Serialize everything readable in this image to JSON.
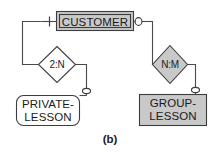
{
  "figure": {
    "caption": "(b)",
    "type": "entity-relationship-diagram"
  },
  "colors": {
    "fill_gray": "#c9c9c9",
    "fill_white": "#ffffff",
    "stroke": "#3d3d3d",
    "edge": "#4a4a4a",
    "text": "#1a1a1a",
    "background": "#ffffff"
  },
  "entities": {
    "customer": {
      "label": "CUSTOMER",
      "shape": "double-rectangle",
      "fill": "#c9c9c9"
    },
    "private_lesson": {
      "label_line1": "PRIVATE-",
      "label_line2": "LESSON",
      "shape": "rounded-rectangle",
      "fill": "#ffffff"
    },
    "group_lesson": {
      "label_line1": "GROUP-",
      "label_line2": "LESSON",
      "shape": "rectangle",
      "fill": "#c9c9c9"
    }
  },
  "relationships": {
    "left": {
      "label": "2:N",
      "shape": "diamond",
      "fill": "#ffffff"
    },
    "right": {
      "label": "N:M",
      "shape": "diamond",
      "fill": "#c9c9c9"
    }
  },
  "connectors": {
    "customer_left": {
      "symbol": "mandatory-tick",
      "glyph": "|"
    },
    "customer_right": {
      "symbol": "optional-circle",
      "glyph": "o"
    },
    "private_lesson_top": {
      "symbol": "optional-circle",
      "glyph": "o"
    },
    "group_lesson_top": {
      "symbol": "optional-circle",
      "glyph": "o"
    }
  }
}
